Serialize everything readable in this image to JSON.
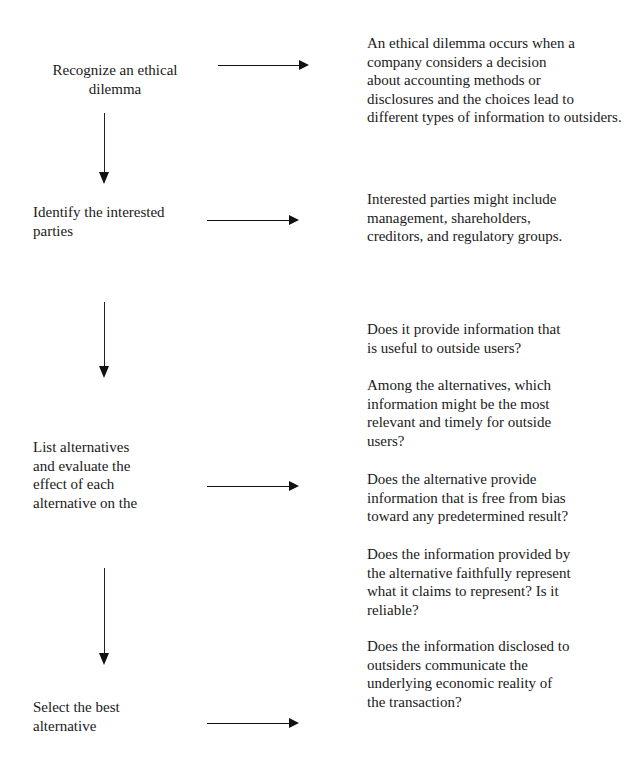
{
  "steps": [
    {
      "label": "Recognize an ethical\ndilemma"
    },
    {
      "label": "Identify the interested\nparties"
    },
    {
      "label": "List alternatives\nand evaluate the\neffect of each\nalternative on the"
    },
    {
      "label": "Select the best\nalternative"
    }
  ],
  "explanations": {
    "recognize": "An ethical dilemma occurs when a\ncompany considers a decision\nabout accounting methods or\ndisclosures and the choices lead to\ndifferent types of information to outsiders.",
    "identify": "Interested parties might include\nmanagement, shareholders,\ncreditors, and regulatory groups.",
    "questions": [
      "Does it provide information that\nis useful to outside users?",
      "Among the alternatives, which\ninformation might be the most\nrelevant and timely for outside\nusers?",
      "Does the alternative provide\ninformation that is free from bias\ntoward any predetermined result?",
      "Does the information provided by\nthe alternative faithfully represent\nwhat it claims to represent?  Is it\nreliable?",
      "Does the information disclosed to\noutsiders communicate the\nunderlying economic reality of\nthe transaction?"
    ]
  }
}
